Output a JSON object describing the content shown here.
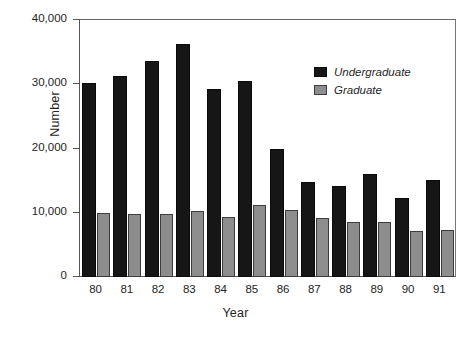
{
  "chart_data": {
    "type": "bar",
    "title": "",
    "xlabel": "Year",
    "ylabel": "Number",
    "categories": [
      "80",
      "81",
      "82",
      "83",
      "84",
      "85",
      "86",
      "87",
      "88",
      "89",
      "90",
      "91"
    ],
    "series": [
      {
        "name": "Undergraduate",
        "color": "#161616",
        "values": [
          30200,
          31300,
          33600,
          36200,
          29300,
          30500,
          19900,
          14800,
          14200,
          16100,
          12300,
          15100
        ]
      },
      {
        "name": "Graduate",
        "color": "#8d8d8d",
        "values": [
          9900,
          9850,
          9750,
          10200,
          9300,
          11200,
          10400,
          9200,
          8600,
          8500,
          7100,
          7300
        ]
      }
    ],
    "ylim": [
      0,
      40000
    ],
    "yticks": [
      0,
      10000,
      20000,
      30000,
      40000
    ],
    "ytick_labels": [
      "0",
      "10,000",
      "20,000",
      "30,000",
      "40,000"
    ],
    "grid": false,
    "legend_position": "top-right",
    "legend_style": "italic"
  }
}
